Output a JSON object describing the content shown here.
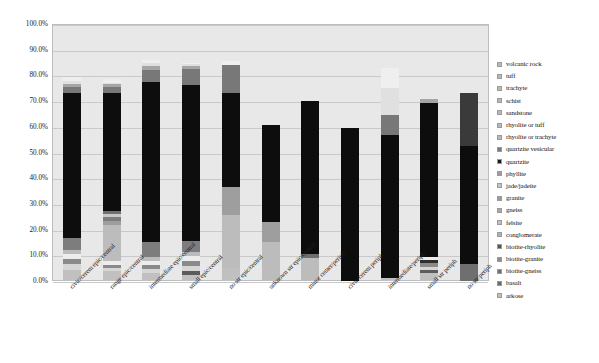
{
  "chart_data": {
    "type": "bar",
    "subtype": "stacked-column-percent",
    "title": "",
    "xlabel": "",
    "ylabel": "",
    "ylim": [
      0,
      100
    ],
    "ytick_labels": [
      "0.0%",
      "10.0%",
      "20.0%",
      "30.0%",
      "40.0%",
      "50.0%",
      "60.0%",
      "70.0%",
      "80.0%",
      "90.0%",
      "100.0%"
    ],
    "ytick_values": [
      0,
      10,
      20,
      30,
      40,
      50,
      60,
      70,
      80,
      90,
      100
    ],
    "grid": true,
    "legend_position": "right",
    "categories": [
      "civic/cerem epic/central",
      "range epic/central",
      "intermediate epic/central",
      "small epic/central",
      "no str epic/central",
      "unknown str epic/central",
      "minor center/periph",
      "civic/cerem periph",
      "intermediate/periph",
      "small str periph",
      "no str/periph"
    ],
    "series": [
      {
        "name": "arkose",
        "color": "#c0c0c0",
        "values": [
          4.2,
          4.0,
          3.0,
          2.3,
          5.2,
          0.0,
          0.0,
          0.0,
          1.2,
          3.0,
          0.0
        ]
      },
      {
        "name": "basalt",
        "color": "#5c5c5c",
        "values": [
          0.0,
          0.0,
          0.0,
          1.6,
          0.0,
          0.0,
          0.0,
          0.0,
          0.0,
          1.2,
          0.0
        ]
      },
      {
        "name": "biotite-gneiss",
        "color": "#d6d6d6",
        "values": [
          2.4,
          1.0,
          1.5,
          2.0,
          0.0,
          0.0,
          0.0,
          0.0,
          0.0,
          1.4,
          0.0
        ]
      },
      {
        "name": "biotite-granite",
        "color": "#8a8a8a",
        "values": [
          1.9,
          1.3,
          1.7,
          1.9,
          0.0,
          0.0,
          0.0,
          0.0,
          0.0,
          1.6,
          0.0
        ]
      },
      {
        "name": "biotite-rhyolite",
        "color": "#2e2e2e",
        "values": [
          0.0,
          0.0,
          0.0,
          0.0,
          0.0,
          0.0,
          0.0,
          0.0,
          0.0,
          1.0,
          0.0
        ]
      },
      {
        "name": "conglomerate",
        "color": "#ededed",
        "values": [
          2.1,
          1.4,
          1.5,
          2.0,
          0.0,
          0.0,
          0.0,
          0.0,
          0.0,
          1.2,
          0.0
        ]
      },
      {
        "name": "felsite",
        "color": "#bcbcbc",
        "values": [
          1.6,
          14.0,
          1.6,
          1.4,
          20.6,
          15.0,
          9.0,
          0.0,
          0.0,
          0.0,
          0.0
        ]
      },
      {
        "name": "gneiss",
        "color": "#9e9e9e",
        "values": [
          0.0,
          1.5,
          0.0,
          0.0,
          10.8,
          7.8,
          0.0,
          0.0,
          0.0,
          0.0,
          0.0
        ]
      },
      {
        "name": "granite",
        "color": "#7d7d7d",
        "values": [
          4.4,
          1.8,
          6.0,
          4.3,
          0.0,
          0.0,
          0.0,
          0.0,
          0.0,
          0.0,
          0.0
        ]
      },
      {
        "name": "jade/jadeite",
        "color": "#c8c8c8",
        "values": [
          0.0,
          1.0,
          0.0,
          0.0,
          0.0,
          0.0,
          0.0,
          0.0,
          0.0,
          0.0,
          0.0
        ]
      },
      {
        "name": "phyllite",
        "color": "#6f6f6f",
        "values": [
          0.0,
          1.2,
          0.0,
          0.0,
          0.0,
          0.0,
          1.4,
          0.0,
          0.0,
          0.0,
          6.8
        ]
      },
      {
        "name": "quartzite",
        "color": "#0d0d0d",
        "values": [
          56.4,
          46.0,
          62.0,
          60.8,
          36.6,
          38.0,
          59.6,
          59.5,
          55.8,
          60.0,
          45.8
        ]
      },
      {
        "name": "quartzite vesicular",
        "color": "#3a3a3a",
        "values": [
          0.0,
          0.0,
          0.0,
          0.0,
          0.0,
          0.0,
          0.0,
          0.0,
          0.0,
          0.0,
          20.6
        ]
      },
      {
        "name": "rhyolite or trachyte",
        "color": "#787878",
        "values": [
          2.6,
          2.4,
          5.0,
          6.2,
          11.0,
          0.0,
          0.0,
          0.0,
          7.6,
          0.0,
          0.0
        ]
      },
      {
        "name": "rhyolite or tuff",
        "color": "#a5a5a5",
        "values": [
          1.2,
          1.0,
          1.4,
          1.0,
          0.0,
          0.0,
          0.0,
          0.0,
          0.0,
          1.6,
          0.0
        ]
      },
      {
        "name": "sandstone",
        "color": "#e0e0e0",
        "values": [
          0.9,
          0.6,
          1.0,
          0.8,
          0.0,
          0.0,
          0.0,
          0.0,
          10.4,
          0.0,
          0.0
        ]
      },
      {
        "name": "schist",
        "color": "#bfbfbf",
        "values": [
          0.0,
          0.0,
          0.0,
          0.0,
          0.0,
          0.0,
          0.0,
          0.0,
          0.0,
          0.0,
          0.0
        ]
      },
      {
        "name": "trachyte",
        "color": "#d2d2d2",
        "values": [
          0.0,
          0.0,
          0.0,
          0.0,
          0.0,
          0.0,
          0.0,
          0.0,
          0.0,
          0.0,
          0.0
        ]
      },
      {
        "name": "tuff",
        "color": "#efefef",
        "values": [
          1.8,
          1.3,
          1.3,
          0.7,
          1.4,
          0.0,
          0.0,
          0.0,
          7.7,
          0.0,
          0.0
        ]
      },
      {
        "name": "volcanic rock",
        "color": "#f5f5f5",
        "values": [
          0.0,
          0.0,
          0.0,
          0.0,
          0.0,
          0.0,
          0.0,
          0.0,
          0.0,
          0.0,
          0.0
        ]
      }
    ]
  },
  "legend": {
    "items": [
      {
        "label": "volcanic rock",
        "color": "#b8b8b8"
      },
      {
        "label": "tuff",
        "color": "#b8b8b8"
      },
      {
        "label": "trachyte",
        "color": "#b8b8b8"
      },
      {
        "label": "schist",
        "color": "#b8b8b8"
      },
      {
        "label": "sandstone",
        "color": "#b8b8b8"
      },
      {
        "label": "rhyolite or tuff",
        "color": "#b8b8b8"
      },
      {
        "label": "rhyolite or trachyte",
        "color": "#b8b8b8"
      },
      {
        "label": "quartzite vesicular",
        "color": "#7a7a7a"
      },
      {
        "label": "quartzite",
        "color": "#1a1a1a"
      },
      {
        "label": "phyllite",
        "color": "#9e9e9e"
      },
      {
        "label": "jade/jadeite",
        "color": "#c4c4c4"
      },
      {
        "label": "granite",
        "color": "#9a9a9a"
      },
      {
        "label": "gneiss",
        "color": "#a8a8a8"
      },
      {
        "label": "felsite",
        "color": "#c0c0c0"
      },
      {
        "label": "conglomerate",
        "color": "#b0b0b0"
      },
      {
        "label": "biotite-rhyolite",
        "color": "#555555"
      },
      {
        "label": "biotite-granite",
        "color": "#8e8e8e"
      },
      {
        "label": "biotite-gneiss",
        "color": "#707070"
      },
      {
        "label": "basalt",
        "color": "#6a6a6a"
      },
      {
        "label": "arkose",
        "color": "#c0c0c0"
      }
    ]
  },
  "caption": ""
}
